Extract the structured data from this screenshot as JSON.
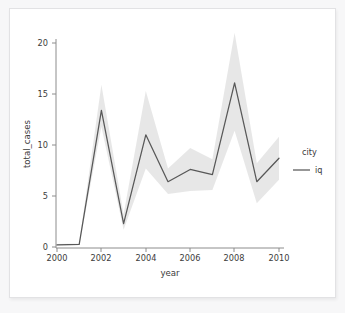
{
  "figure": {
    "background_color": "#ffffff",
    "page_background_color": "#f7f7f8",
    "border_color": "#e2e2e4"
  },
  "chart_data": {
    "type": "line",
    "title": "",
    "xlabel": "year",
    "ylabel": "total_cases",
    "x": [
      2000,
      2001,
      2002,
      2003,
      2004,
      2005,
      2006,
      2007,
      2008,
      2009,
      2010
    ],
    "xtick_labels": [
      "2000",
      "2002",
      "2004",
      "2006",
      "2008",
      "2010"
    ],
    "xticks": [
      2000,
      2002,
      2004,
      2006,
      2008,
      2010
    ],
    "ytick_labels": [
      "0",
      "5",
      "10",
      "15",
      "20"
    ],
    "yticks": [
      0,
      5,
      10,
      15,
      20
    ],
    "xlim": [
      1999.5,
      2010.5
    ],
    "ylim": [
      -1.0,
      22.0
    ],
    "grid": false,
    "legend_position": "right",
    "legend_title": "city",
    "series": [
      {
        "name": "iq",
        "color": "#585858",
        "values": [
          0.2,
          0.25,
          13.4,
          2.3,
          11.0,
          6.4,
          7.6,
          7.1,
          16.1,
          6.4,
          8.7
        ],
        "band_lower": [
          0.15,
          0.2,
          11.8,
          1.7,
          7.7,
          5.2,
          5.5,
          5.6,
          11.4,
          4.3,
          6.6
        ],
        "band_upper": [
          0.3,
          0.35,
          15.9,
          3.2,
          15.3,
          7.7,
          9.7,
          8.6,
          21.0,
          8.2,
          10.8
        ],
        "band_opacity": 0.14
      }
    ]
  },
  "legend": {
    "title": "city",
    "entries": [
      {
        "label": "iq",
        "color": "#585858"
      }
    ]
  },
  "axes": {
    "x_title": "year",
    "y_title": "total_cases"
  }
}
